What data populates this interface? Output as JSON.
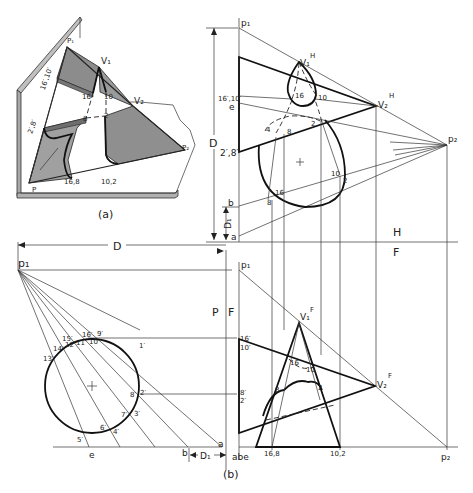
{
  "figure": {
    "subfigure_a": {
      "caption": "(a)",
      "labels": {
        "P1": "P₁",
        "P2": "P₂",
        "V1": "V₁",
        "V2": "V₂",
        "16p10p": "16′,10′",
        "2p8p": "2′,8′",
        "16": "16",
        "10": "10",
        "8": "8",
        "2": "2",
        "16_8": "16,8",
        "10_2": "10,2",
        "P": "P"
      }
    },
    "top_view": {
      "labels": {
        "p1": "p₁",
        "p2": "p₂",
        "V1H": "V₁",
        "V1H_sup": "H",
        "V2H": "V₂",
        "V2H_sup": "H",
        "16p10p": "16′,10′",
        "e": "e",
        "2p8p": "2′,8′",
        "b": "b",
        "a": "a",
        "D": "D",
        "D1": "D₁",
        "pt16_upper": "16",
        "pt10_upper": "10",
        "pt8": "8",
        "pt2": "2",
        "pt4": "4",
        "pt10_lower": "10",
        "pt2_lower": "2",
        "pt16_lower": "16",
        "pt8_lower": "8",
        "fold_H": "H",
        "fold_F": "F"
      }
    },
    "auxiliary_view": {
      "labels": {
        "p1": "p₁",
        "D": "D",
        "D1": "D₁",
        "P": "P",
        "F": "F",
        "a": "a",
        "b": "b",
        "e": "e",
        "points": [
          "1′",
          "2′",
          "3′",
          "4′",
          "5′",
          "6′",
          "7′",
          "8′",
          "9′",
          "10′",
          "11′",
          "12′",
          "13′",
          "14′",
          "15′",
          "16′"
        ]
      }
    },
    "front_view": {
      "caption": "(b)",
      "labels": {
        "p1": "p₁",
        "p2": "p₂",
        "V1F": "V₁",
        "V1F_sup": "F",
        "V2F": "V₂",
        "V2F_sup": "F",
        "16p": "16′",
        "10p": "10′",
        "8p": "8′",
        "2p": "2′",
        "abe": "abe",
        "16_8": "16,8",
        "10_2": "10,2",
        "pt16": "16",
        "pt10": "10",
        "pt8": "8",
        "pt2": "2"
      }
    }
  }
}
